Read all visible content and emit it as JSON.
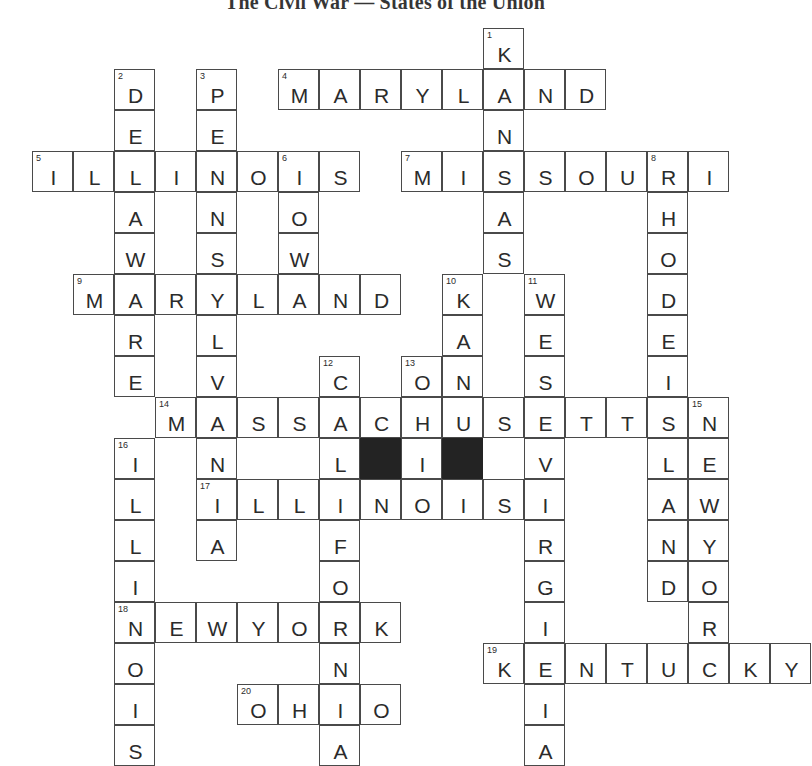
{
  "title": "The Civil War — States of the Union",
  "puzzle": {
    "type": "crossword",
    "cell_size": 41,
    "origin_x": 32,
    "origin_y": 28,
    "cols": 18,
    "rows": 18,
    "block_color": "#232323",
    "grid_color": "#4a4a4a",
    "letter_color": "#2b2b2b"
  },
  "entries": [
    {
      "number": "1",
      "answer": "KANSAS",
      "direction": "down",
      "col": 11,
      "row": 0
    },
    {
      "number": "2",
      "answer": "DELAWARE",
      "direction": "down",
      "col": 2,
      "row": 1
    },
    {
      "number": "3",
      "answer": "PENNSYLVANIA",
      "direction": "down",
      "col": 4,
      "row": 1
    },
    {
      "number": "4",
      "answer": "MARYLAND",
      "direction": "across",
      "col": 6,
      "row": 1
    },
    {
      "number": "5",
      "answer": "ILLINOIS",
      "direction": "across",
      "col": 0,
      "row": 3
    },
    {
      "number": "6",
      "answer": "IOWA",
      "direction": "down",
      "col": 6,
      "row": 3
    },
    {
      "number": "7",
      "answer": "MISSOURI",
      "direction": "across",
      "col": 9,
      "row": 3
    },
    {
      "number": "8",
      "answer": "RHODEISLAND",
      "direction": "down",
      "col": 15,
      "row": 3
    },
    {
      "number": "9",
      "answer": "MARYLAND",
      "direction": "across",
      "col": 1,
      "row": 6
    },
    {
      "number": "10",
      "answer": "KANSAS",
      "direction": "down",
      "col": 10,
      "row": 6
    },
    {
      "number": "11",
      "answer": "WESTVIRGINIA",
      "direction": "down",
      "col": 12,
      "row": 6
    },
    {
      "number": "12",
      "answer": "CALIFORNIA",
      "direction": "down",
      "col": 7,
      "row": 8
    },
    {
      "number": "13",
      "answer": "OHIO",
      "direction": "down",
      "col": 9,
      "row": 8
    },
    {
      "number": "14",
      "answer": "MASSACHUSETTS",
      "direction": "across",
      "col": 3,
      "row": 9
    },
    {
      "number": "15",
      "answer": "NEWYORK",
      "direction": "down",
      "col": 16,
      "row": 9
    },
    {
      "number": "16",
      "answer": "ILLINOIS",
      "direction": "down",
      "col": 2,
      "row": 10
    },
    {
      "number": "17",
      "answer": "ILLINOIS",
      "direction": "across",
      "col": 4,
      "row": 11
    },
    {
      "number": "18",
      "answer": "NEWYORK",
      "direction": "across",
      "col": 2,
      "row": 14
    },
    {
      "number": "19",
      "answer": "KENTUCKY",
      "direction": "across",
      "col": 11,
      "row": 15
    },
    {
      "number": "20",
      "answer": "OHIO",
      "direction": "across",
      "col": 5,
      "row": 16
    }
  ],
  "blocks": [
    {
      "col": 8,
      "row": 10
    },
    {
      "col": 10,
      "row": 10
    }
  ]
}
